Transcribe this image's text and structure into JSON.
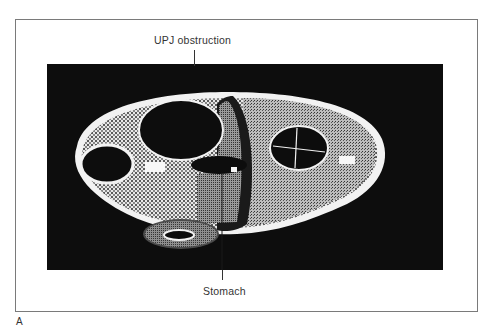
{
  "figure": {
    "panel_letter": "A",
    "annotations": {
      "top": "UPJ obstruction",
      "bottom": "Stomach"
    }
  },
  "colors": {
    "frame_border": "#7a7a7a",
    "background_panel": "#0d0d0d",
    "body_outline": "#f2f2f2",
    "stomach_gray": "#8a8a8a",
    "text": "#333333"
  }
}
